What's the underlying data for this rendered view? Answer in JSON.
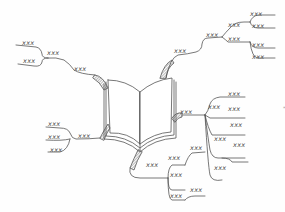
{
  "diagram": {
    "type": "mind-map",
    "center": {
      "icon": "open-book-icon"
    },
    "stroke_color": "#555555",
    "background": "#fefefe",
    "branches": [
      {
        "name": "top-left",
        "label": "xxx",
        "children": [
          {
            "label": "xxx",
            "children": [
              {
                "label": "xxx"
              },
              {
                "label": "xxx"
              }
            ]
          }
        ]
      },
      {
        "name": "top-right",
        "label": "xxx",
        "children": [
          {
            "label": "xxx",
            "children": [
              {
                "label": "xxx",
                "children": [
                  {
                    "label": "xxx"
                  },
                  {
                    "label": "xxx"
                  }
                ]
              },
              {
                "label": "xxx",
                "children": [
                  {
                    "label": "xxx"
                  },
                  {
                    "label": "xxx"
                  }
                ]
              }
            ]
          }
        ]
      },
      {
        "name": "bottom-left",
        "label": "xxx",
        "children": [
          {
            "label": "xxx"
          },
          {
            "label": "xxx"
          },
          {
            "label": "xxx"
          }
        ]
      },
      {
        "name": "right",
        "label": "xxx",
        "children": [
          {
            "label": "xxx",
            "children": [
              {
                "label": "xxx"
              },
              {
                "label": "xxx"
              },
              {
                "label": "xxx"
              }
            ]
          },
          {
            "label": "xxx",
            "children": [
              {
                "label": "xxx"
              }
            ]
          },
          {
            "label": "xxx"
          }
        ]
      },
      {
        "name": "bottom",
        "label": "xxx",
        "children": [
          {
            "label": "xxx",
            "children": [
              {
                "label": "xxx"
              }
            ]
          },
          {
            "label": "xxx"
          },
          {
            "label": "xxx",
            "children": [
              {
                "label": "xxx"
              }
            ]
          }
        ]
      }
    ],
    "stray_mark": "*"
  },
  "labels": {
    "tl1": "xxx",
    "tl2": "xxx",
    "tl3": "xxx",
    "tl4": "xxx",
    "tr1": "xxx",
    "tr2": "xxx",
    "tr3": "xxx",
    "tr4": "xxx",
    "tr5": "xxx",
    "tr6": "xxx",
    "tr7": "xxx",
    "tr8": "xxx",
    "tr9": "xxx",
    "bl1": "xxx",
    "bl2": "xxx",
    "bl3": "xxx",
    "bl4": "xxx",
    "r1": "xxx",
    "r2": "xxx",
    "r3": "xxx",
    "r4": "xxx",
    "r5": "xxx",
    "r6": "xxx",
    "r7": "xxx",
    "r8": "xxx",
    "r9": "xxx",
    "b1": "xxx",
    "b2": "xxx",
    "b3": "xxx",
    "b4": "xxx",
    "b5": "xxx",
    "b6": "xxx"
  }
}
